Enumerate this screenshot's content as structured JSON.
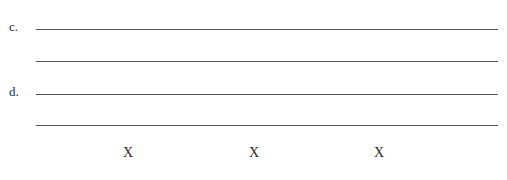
{
  "items": [
    {
      "label": "c.",
      "lines": 2
    },
    {
      "label": "d.",
      "lines": 2
    }
  ],
  "marks": [
    "X",
    "X",
    "X"
  ],
  "colors": {
    "ink": "#2a2a2a",
    "rule": "#555555",
    "background": "#ffffff"
  }
}
